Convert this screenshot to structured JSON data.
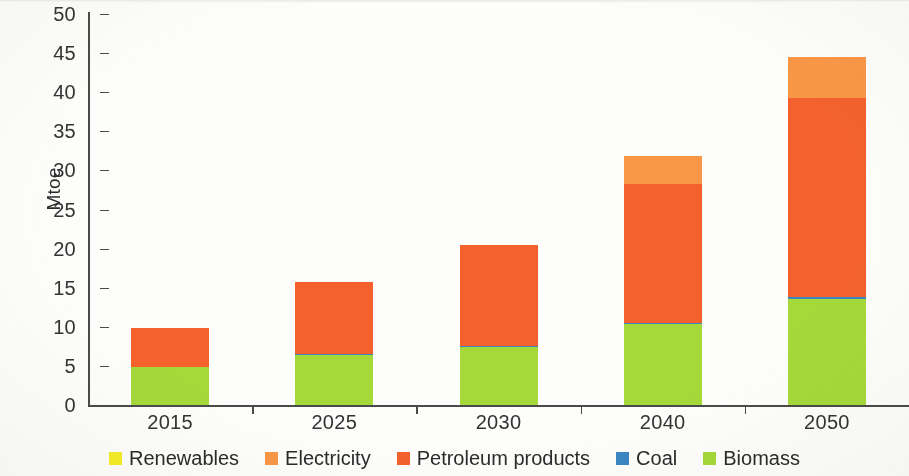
{
  "chart_data": {
    "type": "bar",
    "subtype": "stacked",
    "title": "",
    "xlabel": "",
    "ylabel": "Mtoe",
    "ylim": [
      0,
      50
    ],
    "ytick_step": 5,
    "yticks": [
      0,
      5,
      10,
      15,
      20,
      25,
      30,
      35,
      40,
      45,
      50
    ],
    "grid": false,
    "legend_position": "bottom",
    "categories": [
      "2015",
      "2025",
      "2030",
      "2040",
      "2050"
    ],
    "series": [
      {
        "name": "Renewables",
        "color": "#f5ec26",
        "values": [
          0,
          0,
          0,
          0,
          0
        ]
      },
      {
        "name": "Electricity",
        "color": "#f99746",
        "values": [
          0,
          0,
          0,
          3.5,
          5.2
        ]
      },
      {
        "name": "Petroleum products",
        "color": "#f4612c",
        "values": [
          5.1,
          9.2,
          12.8,
          17.8,
          25.5
        ]
      },
      {
        "name": "Coal",
        "color": "#3a87c4",
        "values": [
          0,
          0.1,
          0.1,
          0.2,
          0.2
        ]
      },
      {
        "name": "Biomass",
        "color": "#a5d93a",
        "values": [
          4.8,
          6.4,
          7.5,
          10.3,
          13.6
        ]
      }
    ],
    "totals": [
      9.9,
      15.7,
      20.4,
      31.8,
      44.5
    ],
    "stack_order_bottom_to_top": [
      "Biomass",
      "Coal",
      "Petroleum products",
      "Electricity",
      "Renewables"
    ]
  },
  "legend": {
    "items": [
      {
        "label": "Renewables"
      },
      {
        "label": "Electricity"
      },
      {
        "label": "Petroleum products"
      },
      {
        "label": "Coal"
      },
      {
        "label": "Biomass"
      }
    ]
  },
  "axis": {
    "y_label": "Mtoe"
  }
}
